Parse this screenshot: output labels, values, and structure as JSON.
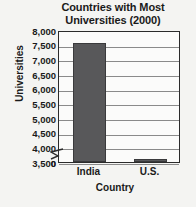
{
  "chart_data": {
    "type": "bar",
    "title": "Countries with Most Universities (2000)",
    "title_lines": [
      "Countries with Most",
      "Universities (2000)"
    ],
    "categories": [
      "India",
      "U.S."
    ],
    "values": [
      7550,
      3600
    ],
    "xlabel": "Country",
    "ylabel": "Universities",
    "ylim": [
      3500,
      8000
    ],
    "y_axis_break": true,
    "y_break_label": "0",
    "yticks": [
      8000,
      7500,
      7000,
      6500,
      6000,
      5500,
      5000,
      4500,
      4000,
      3500
    ],
    "ytick_labels": [
      "8,000",
      "7,500",
      "7,000",
      "6,500",
      "6,000",
      "5,500",
      "5,000",
      "4,500",
      "4,000",
      "3,500"
    ],
    "grid": true,
    "legend": null,
    "bar_color": "#58585a",
    "plot_background": "#fbfbfa",
    "page_background": "#f4f4f2",
    "axis_color": "#2b2b2b",
    "gridline_color": "#8a8a8a"
  }
}
